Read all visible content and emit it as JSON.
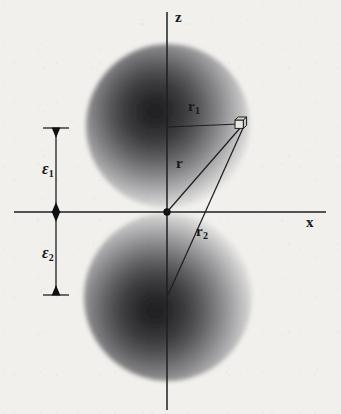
{
  "figure": {
    "domain": "physics-diagram",
    "width": 341,
    "height": 414,
    "background_color": "#f2f0ed",
    "ink_color": "#16181a"
  },
  "axes": {
    "z": {
      "label": "z",
      "orientation": "vertical",
      "x": 167,
      "y_top": 12,
      "y_bottom": 410,
      "label_x": 175,
      "label_y": 11
    },
    "x": {
      "label": "x",
      "orientation": "horizontal",
      "y": 212,
      "x_left": 14,
      "x_right": 326,
      "label_x": 306,
      "label_y": 216
    },
    "origin": {
      "x": 167,
      "y": 212,
      "marker": "filled-dot",
      "radius": 3.6
    }
  },
  "spheres": [
    {
      "name": "upper-sphere",
      "cx": 168,
      "cy": 126,
      "r": 82,
      "gradient_cx": 150,
      "gradient_cy": 112,
      "core_color": "#2b2b2d",
      "edge_color": "#f2f0ed"
    },
    {
      "name": "lower-sphere",
      "cx": 168,
      "cy": 297,
      "r": 84,
      "gradient_cx": 150,
      "gradient_cy": 312,
      "core_color": "#2b2b2d",
      "edge_color": "#f2f0ed"
    }
  ],
  "field_point": {
    "name": "volume-element",
    "x": 242,
    "y": 124,
    "marker": "small-3d-cube",
    "size": 11
  },
  "vectors": [
    {
      "name": "r1",
      "label": "r",
      "subscript": "1",
      "from_x": 168,
      "from_y": 127,
      "to_x": 239,
      "to_y": 124,
      "label_x": 188,
      "label_y": 101
    },
    {
      "name": "r",
      "label": "r",
      "subscript": "",
      "from_x": 167,
      "from_y": 212,
      "to_x": 241,
      "to_y": 127,
      "label_x": 176,
      "label_y": 157
    },
    {
      "name": "r2",
      "label": "r",
      "subscript": "2",
      "from_x": 168,
      "from_y": 295,
      "to_x": 243,
      "to_y": 128,
      "label_x": 196,
      "label_y": 225
    }
  ],
  "dimension_brackets": [
    {
      "name": "epsilon-1",
      "label": "ε",
      "subscript": "1",
      "x": 56,
      "y_top": 128,
      "y_bottom": 212,
      "tick_half_width": 13,
      "label_x": 44,
      "label_y": 162
    },
    {
      "name": "epsilon-2",
      "label": "ε",
      "subscript": "2",
      "x": 56,
      "y_top": 212,
      "y_bottom": 295,
      "tick_half_width": 13,
      "label_x": 44,
      "label_y": 246
    }
  ]
}
